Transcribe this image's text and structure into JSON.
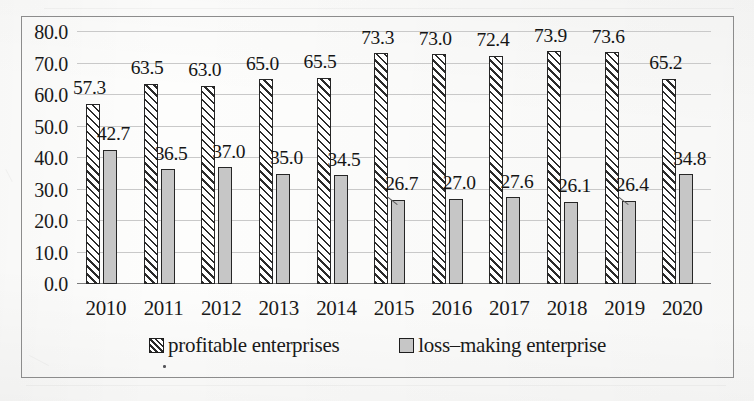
{
  "chart_data": {
    "type": "bar",
    "title": "",
    "subtitle": "",
    "xlabel": "",
    "ylabel": "",
    "categories": [
      "2010",
      "2011",
      "2012",
      "2013",
      "2014",
      "2015",
      "2016",
      "2017",
      "2018",
      "2019",
      "2020"
    ],
    "series": [
      {
        "name": "profitable enterprises",
        "values": [
          57.3,
          63.5,
          63.0,
          65.0,
          65.5,
          73.3,
          73.0,
          72.4,
          73.9,
          73.6,
          65.2
        ],
        "labels": [
          "57.3",
          "63.5",
          "63.0",
          "65.0",
          "65.5",
          "73.3",
          "73.0",
          "72.4",
          "73.9",
          "73.6",
          "65.2"
        ],
        "fill": "diagonal-hatch",
        "color": "#ffffff",
        "edge_color": "#262626"
      },
      {
        "name": "loss–making enterprise",
        "values": [
          42.7,
          36.5,
          37.0,
          35.0,
          34.5,
          26.7,
          27.0,
          27.6,
          26.1,
          26.4,
          34.8
        ],
        "labels": [
          "42.7",
          "36.5",
          "37.0",
          "35.0",
          "34.5",
          "26.7",
          "27.0",
          "27.6",
          "26.1",
          "26.4",
          "34.8"
        ],
        "fill": "solid",
        "color": "#c6c6c6",
        "edge_color": "#262626"
      }
    ],
    "ylim": [
      0.0,
      80.0
    ],
    "yticks": [
      "0.0",
      "10.0",
      "20.0",
      "30.0",
      "40.0",
      "50.0",
      "60.0",
      "70.0",
      "80.0"
    ],
    "ytick_values": [
      0,
      10,
      20,
      30,
      40,
      50,
      60,
      70,
      80
    ],
    "grid": true,
    "grid_axis": "y",
    "grid_color": "#c9c9c9",
    "legend_position": "bottom-center",
    "plot_border": true,
    "border_color": "#8c8c8c",
    "background": "#fdfdfc",
    "labels_with_leader_lines": [
      "26.7",
      "26.4"
    ]
  },
  "legend": {
    "items": [
      {
        "label": "profitable enterprises",
        "swatch": "hatched-square"
      },
      {
        "label": "loss–making enterprise",
        "swatch": "gray-square"
      }
    ]
  }
}
